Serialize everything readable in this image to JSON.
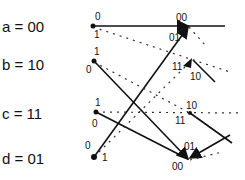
{
  "states": [
    {
      "label": "a = 00",
      "y": 20
    },
    {
      "label": "b = 10",
      "y": 57
    },
    {
      "label": "c = 11",
      "y": 107
    },
    {
      "label": "d = 01",
      "y": 150
    }
  ],
  "input_labels": {
    "a_top": "0",
    "a_bottom": "1",
    "b_top": "1",
    "b_bottom": "0",
    "c_top": "1",
    "c_bottom": "0",
    "d_top": "0",
    "d_bottom": "1"
  },
  "output_labels": {
    "a_prime_top": "00",
    "a_prime_in": "01",
    "b_prime_top": "11",
    "b_prime_bottom": "10",
    "c_prime_top": "10",
    "c_prime_bottom": "11",
    "d_prime_top": "01",
    "d_prime_bottom": "00"
  },
  "legend": {
    "solid": "input 0",
    "dotted": "input 1"
  }
}
